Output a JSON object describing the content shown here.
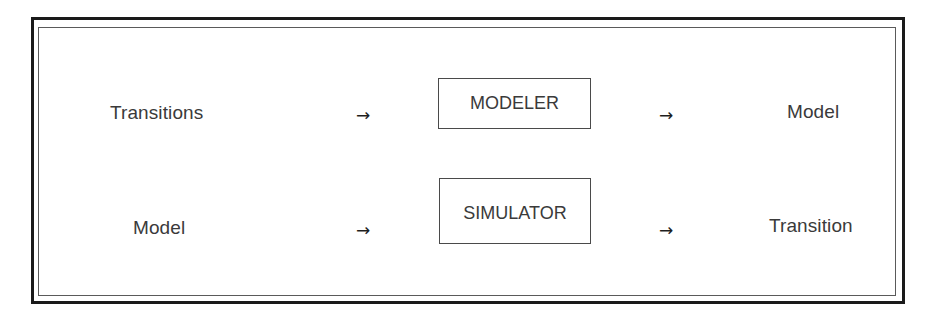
{
  "diagram": {
    "type": "process-flow",
    "rows": [
      {
        "input": "Transitions",
        "arrow_in": "→",
        "process": "MODELER",
        "arrow_out": "→",
        "output": "Model"
      },
      {
        "input": "Model",
        "arrow_in": "→",
        "process": "SIMULATOR",
        "arrow_out": "→",
        "output": "Transition"
      }
    ],
    "colors": {
      "text": "#3a3a3a",
      "border": "#1a1a1a",
      "background": "#ffffff"
    }
  }
}
